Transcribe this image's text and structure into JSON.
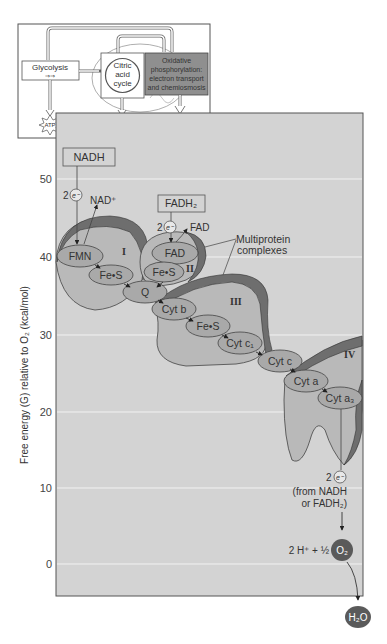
{
  "inset": {
    "glycolysis": "Glycolysis",
    "citric_acid_cycle": [
      "Citric",
      "acid",
      "cycle"
    ],
    "oxidative": [
      "Oxidative",
      "phosphorylation:",
      "electron transport",
      "and chemiosmosis"
    ],
    "atp_labels": [
      "ATP",
      "ATP",
      "ATP"
    ]
  },
  "chart": {
    "ylabel": "Free energy (G) relative to O₂ (kcal/mol)",
    "yticks": [
      "50",
      "40",
      "30",
      "20",
      "10",
      "0"
    ]
  },
  "donors": {
    "nadh": "NADH",
    "nad_plus": "NAD⁺",
    "fadh2": "FADH₂",
    "fad_out": "FAD",
    "two": "2",
    "electron": "e⁻"
  },
  "complexes": {
    "I": "I",
    "II": "II",
    "III": "III",
    "IV": "IV",
    "callout": [
      "Multiprotein",
      "complexes"
    ]
  },
  "carriers": {
    "fmn": "FMN",
    "fes1": "Fe•S",
    "fad": "FAD",
    "fes2": "Fe•S",
    "q": "Q",
    "cytb": "Cyt b",
    "fes3": "Fe•S",
    "cytc1": "Cyt c₁",
    "cytc": "Cyt c",
    "cyta": "Cyt a",
    "cyta3": "Cyt a₃"
  },
  "terminal": {
    "two": "2",
    "electron": "e⁻",
    "from_line1": "(from NADH",
    "from_line2": "or FADH₂)",
    "reaction_prefix": "2 H⁺ + ½",
    "o2": "O₂",
    "h2o": "H₂O"
  },
  "colors": {
    "panel": "#d3d3d3",
    "complex_fill": "#b9b9b9",
    "complex_rim": "#6e6e6e",
    "carrier_fill": "#a9a9a9",
    "oxidative_box": "#8f8f8f",
    "o2_circle": "#5a5a5a"
  }
}
